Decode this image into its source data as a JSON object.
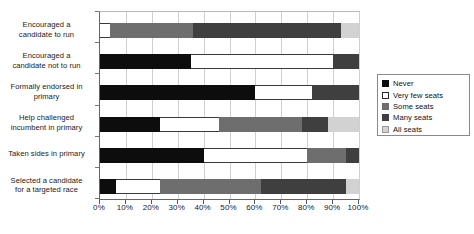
{
  "chart_data": {
    "type": "bar",
    "orientation": "horizontal",
    "stacked": true,
    "stack_mode": "percent",
    "title": "",
    "subtitle": "",
    "xlabel": "",
    "ylabel": "",
    "xlim": [
      0,
      100
    ],
    "grid": true,
    "legend_position": "right",
    "xticks": [
      0,
      10,
      20,
      30,
      40,
      50,
      60,
      70,
      80,
      90,
      100
    ],
    "xtick_labels": [
      "0%",
      "10%",
      "20%",
      "30%",
      "40%",
      "50%",
      "60%",
      "70%",
      "80%",
      "90%",
      "100%"
    ],
    "categories": [
      "Encouraged a candidate to run",
      "Encouraged a candidate not to run",
      "Formally endorsed in primary",
      "Help challenged incumbent in primary",
      "Taken sides in primary",
      "Selected a candidate for a targeted race"
    ],
    "category_lines": [
      [
        "Encouraged a",
        "candidate to run"
      ],
      [
        "Encouraged a",
        "candidate not to run"
      ],
      [
        "Formally endorsed in",
        "primary"
      ],
      [
        "Help challenged",
        "incumbent in primary"
      ],
      [
        "Taken sides in primary"
      ],
      [
        "Selected a candidate",
        "for a targeted race"
      ]
    ],
    "series": [
      {
        "name": "Never",
        "color": "#0d0d0d",
        "values": [
          0,
          35,
          60,
          23,
          40,
          6
        ]
      },
      {
        "name": "Very few seats",
        "color": "#ffffff",
        "values": [
          4,
          55,
          22,
          23,
          40,
          17
        ]
      },
      {
        "name": "Some seats",
        "color": "#6e6e6e",
        "values": [
          32,
          0,
          0,
          32,
          15,
          39
        ]
      },
      {
        "name": "Many seats",
        "color": "#3f3f3f",
        "values": [
          57,
          10,
          18,
          10,
          5,
          33
        ]
      },
      {
        "name": "All seats",
        "color": "#d2d2d2",
        "values": [
          7,
          0,
          0,
          12,
          0,
          5
        ]
      }
    ]
  },
  "legend": {
    "items": [
      {
        "label": "Never"
      },
      {
        "label": "Very few seats"
      },
      {
        "label": "Some seats"
      },
      {
        "label": "Many seats"
      },
      {
        "label": "All seats"
      }
    ]
  }
}
